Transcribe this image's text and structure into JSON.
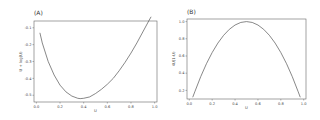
{
  "chart_data": [
    {
      "panel": "(A)",
      "type": "line",
      "title": "(A)",
      "xlabel": "U",
      "ylabel": "U + log(U)",
      "xlim": [
        -0.02,
        1.02
      ],
      "ylim": [
        -0.54,
        -0.06
      ],
      "xticks": [
        "0.0",
        "0.2",
        "0.4",
        "0.6",
        "0.8",
        "1.0"
      ],
      "yticks": [
        "-0.1",
        "-0.2",
        "-0.3",
        "-0.4",
        "-0.5"
      ],
      "grid": false,
      "x": [
        0.03,
        0.05,
        0.1,
        0.15,
        0.2,
        0.25,
        0.3,
        0.35,
        0.37,
        0.4,
        0.45,
        0.5,
        0.55,
        0.6,
        0.65,
        0.7,
        0.75,
        0.8,
        0.85,
        0.9,
        0.95,
        0.97
      ],
      "y": [
        -0.13,
        -0.19,
        -0.3,
        -0.38,
        -0.44,
        -0.48,
        -0.505,
        -0.518,
        -0.52,
        -0.518,
        -0.51,
        -0.49,
        -0.465,
        -0.435,
        -0.4,
        -0.355,
        -0.305,
        -0.25,
        -0.19,
        -0.125,
        -0.06,
        -0.035
      ]
    },
    {
      "panel": "(B)",
      "type": "line",
      "title": "(B)",
      "xlabel": "U",
      "ylabel": "4U(1-U)",
      "xlim": [
        -0.02,
        1.02
      ],
      "ylim": [
        0.1,
        1.03
      ],
      "xticks": [
        "0.0",
        "0.2",
        "0.4",
        "0.6",
        "0.8",
        "1.0"
      ],
      "yticks": [
        "1.0",
        "0.8",
        "0.6",
        "0.4",
        "0.2"
      ],
      "grid": false,
      "x": [
        0.03,
        0.05,
        0.1,
        0.15,
        0.2,
        0.25,
        0.3,
        0.35,
        0.4,
        0.45,
        0.5,
        0.55,
        0.6,
        0.65,
        0.7,
        0.75,
        0.8,
        0.85,
        0.9,
        0.95,
        0.97
      ],
      "y": [
        0.12,
        0.19,
        0.36,
        0.51,
        0.64,
        0.75,
        0.84,
        0.91,
        0.96,
        0.99,
        1.0,
        0.99,
        0.96,
        0.91,
        0.84,
        0.75,
        0.64,
        0.51,
        0.36,
        0.19,
        0.12
      ]
    }
  ],
  "panels": {
    "a": {
      "title": "(A)",
      "xlabel": "U",
      "ylabel": "U + log(U)"
    },
    "b": {
      "title": "(B)",
      "xlabel": "U",
      "ylabel": "4U(1-U)"
    }
  },
  "colors": {
    "line": "#555555",
    "frame": "#666666",
    "text": "#444444"
  }
}
